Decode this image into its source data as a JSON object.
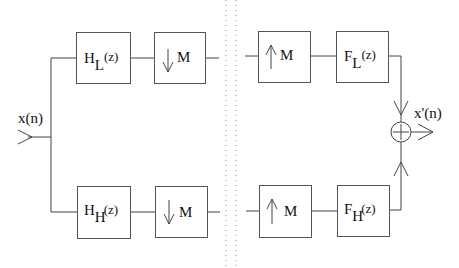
{
  "diagram": {
    "input": {
      "label": "x(n)"
    },
    "output": {
      "label": "x'(n)"
    },
    "analysis": {
      "low": {
        "filter": {
          "main": "H",
          "sub": "L",
          "arg": "(z)"
        },
        "decimator": {
          "arrow": "↓",
          "factor": "M"
        }
      },
      "high": {
        "filter": {
          "main": "H",
          "sub": "H",
          "arg": "(z)"
        },
        "decimator": {
          "arrow": "↓",
          "factor": "M"
        }
      }
    },
    "synthesis": {
      "low": {
        "expander": {
          "arrow": "↑",
          "factor": "M"
        },
        "filter": {
          "main": "F",
          "sub": "L",
          "arg": "(z)"
        }
      },
      "high": {
        "expander": {
          "arrow": "↑",
          "factor": "M"
        },
        "filter": {
          "main": "F",
          "sub": "H",
          "arg": "(z)"
        }
      }
    },
    "adder": {
      "symbol": "+"
    },
    "colors": {
      "line": "#444444",
      "box": "#555555",
      "divider": "#999999",
      "text": "#111111"
    }
  }
}
